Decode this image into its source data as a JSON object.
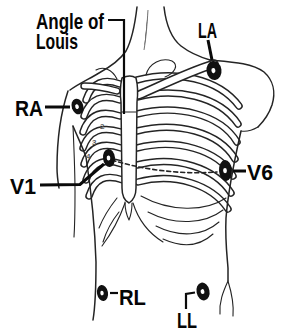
{
  "diagram": {
    "annotation": {
      "line1": "Angle of",
      "line2": "Louis"
    },
    "electrodes": [
      {
        "id": "ra",
        "label": "RA"
      },
      {
        "id": "la",
        "label": "LA"
      },
      {
        "id": "v1",
        "label": "V1"
      },
      {
        "id": "v6",
        "label": "V6"
      },
      {
        "id": "rl",
        "label": "RL"
      },
      {
        "id": "ll",
        "label": "LL"
      }
    ],
    "rib_numbers": [
      "2",
      "3",
      "4"
    ],
    "colors": {
      "ink": "#242424",
      "label_text": "#050505",
      "electrode_fill": "#111111",
      "background": "#ffffff"
    }
  }
}
